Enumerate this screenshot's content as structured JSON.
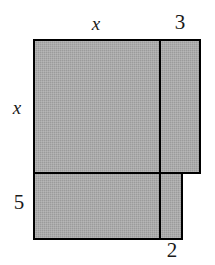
{
  "figure": {
    "kind": "composite-rectangle-area-diagram",
    "colors": {
      "fill": "#a8a8a8",
      "stroke": "#000000",
      "background": "#ffffff",
      "label": "#1a1a1a"
    },
    "stroke_width": 2.5,
    "interior_line_width": 2.5
  },
  "labels": {
    "top_left": "x",
    "top_right": "3",
    "left_upper": "x",
    "left_lower": "5",
    "bottom_right": "2"
  },
  "geometry": {
    "viewbox": {
      "width": 215,
      "height": 265
    },
    "outline_points": [
      [
        34,
        40
      ],
      [
        200,
        40
      ],
      [
        200,
        173
      ],
      [
        182,
        173
      ],
      [
        182,
        239
      ],
      [
        34,
        239
      ]
    ],
    "upper_block": {
      "x": 34,
      "y": 40,
      "width": 166,
      "height": 133
    },
    "lower_block": {
      "x": 34,
      "y": 173,
      "width": 148,
      "height": 66
    },
    "interior_lines": [
      {
        "name": "vertical-divider-upper",
        "x1": 160,
        "y1": 40,
        "x2": 160,
        "y2": 173
      },
      {
        "name": "vertical-divider-lower",
        "x1": 160,
        "y1": 173,
        "x2": 160,
        "y2": 239
      },
      {
        "name": "horizontal-divider",
        "x1": 34,
        "y1": 173,
        "x2": 200,
        "y2": 173
      }
    ],
    "segments": {
      "top_x_span": {
        "from": 34,
        "to": 160
      },
      "top_3_span": {
        "from": 160,
        "to": 200
      },
      "left_x_span": {
        "from": 40,
        "to": 173
      },
      "left_5_span": {
        "from": 173,
        "to": 239
      },
      "bottom_2_span": {
        "from": 160,
        "to": 182
      }
    }
  }
}
